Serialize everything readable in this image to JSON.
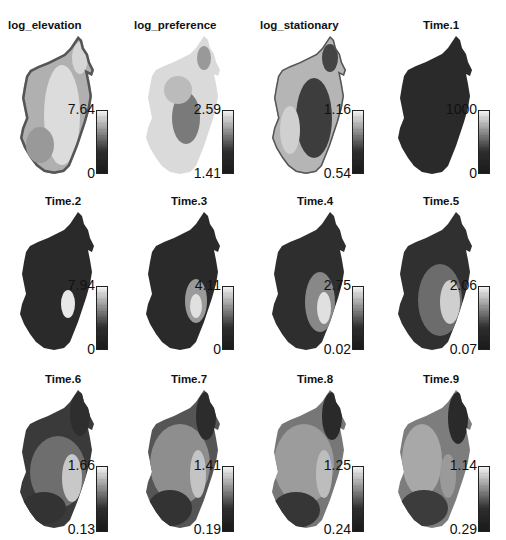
{
  "figure": {
    "panels": [
      {
        "title": "log_elevation",
        "max": "7.64",
        "min": "0",
        "style": "elev"
      },
      {
        "title": "log_preference",
        "max": "2.59",
        "min": "1.41",
        "style": "pref"
      },
      {
        "title": "log_stationary",
        "max": "1.16",
        "min": "0.54",
        "style": "stat"
      },
      {
        "title": "Time.1",
        "max": "1000",
        "min": "0",
        "style": "dark"
      },
      {
        "title": "Time.2",
        "max": "7.94",
        "min": "0",
        "style": "t2"
      },
      {
        "title": "Time.3",
        "max": "4.11",
        "min": "0",
        "style": "t3"
      },
      {
        "title": "Time.4",
        "max": "2.75",
        "min": "0.02",
        "style": "t4"
      },
      {
        "title": "Time.5",
        "max": "2.06",
        "min": "0.07",
        "style": "t5"
      },
      {
        "title": "Time.6",
        "max": "1.66",
        "min": "0.13",
        "style": "t6"
      },
      {
        "title": "Time.7",
        "max": "1.41",
        "min": "0.19",
        "style": "t7"
      },
      {
        "title": "Time.8",
        "max": "1.25",
        "min": "0.24",
        "style": "t8"
      },
      {
        "title": "Time.9",
        "max": "1.14",
        "min": "0.29",
        "style": "t9"
      }
    ]
  },
  "chart_data": {
    "type": "heatmap",
    "layout": {
      "rows": 3,
      "cols": 4
    },
    "colormap": "grayscale (dark = low, light = high)",
    "panels": [
      {
        "title": "log_elevation",
        "range": [
          0,
          7.64
        ]
      },
      {
        "title": "log_preference",
        "range": [
          1.41,
          2.59
        ]
      },
      {
        "title": "log_stationary",
        "range": [
          0.54,
          1.16
        ]
      },
      {
        "title": "Time.1",
        "range": [
          0,
          1000
        ]
      },
      {
        "title": "Time.2",
        "range": [
          0,
          7.94
        ]
      },
      {
        "title": "Time.3",
        "range": [
          0,
          4.11
        ]
      },
      {
        "title": "Time.4",
        "range": [
          0.02,
          2.75
        ]
      },
      {
        "title": "Time.5",
        "range": [
          0.07,
          2.06
        ]
      },
      {
        "title": "Time.6",
        "range": [
          0.13,
          1.66
        ]
      },
      {
        "title": "Time.7",
        "range": [
          0.19,
          1.41
        ]
      },
      {
        "title": "Time.8",
        "range": [
          0.24,
          1.25
        ]
      },
      {
        "title": "Time.9",
        "range": [
          0.29,
          1.14
        ]
      }
    ]
  }
}
